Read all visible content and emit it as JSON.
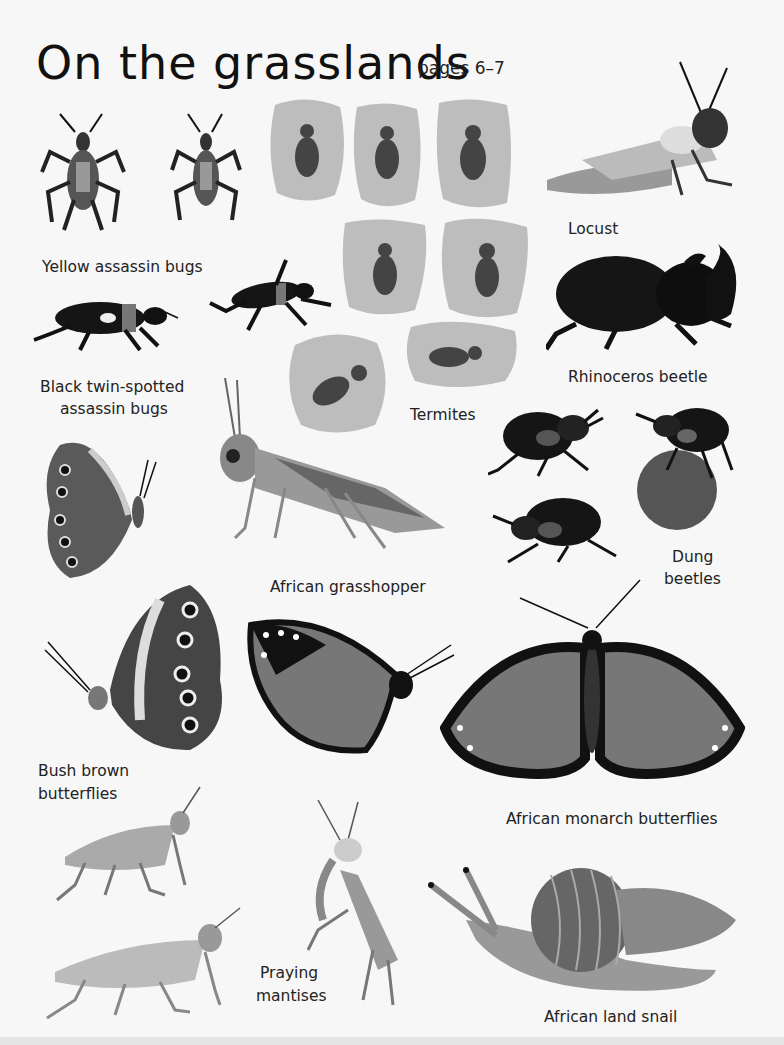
{
  "page": {
    "title": "On the grasslands",
    "subtitle": "pages 6–7"
  },
  "labels": {
    "yellow_assassin": "Yellow assassin bugs",
    "black_assassin_1": "Black twin-spotted",
    "black_assassin_2": "assassin bugs",
    "locust": "Locust",
    "rhino": "Rhinoceros beetle",
    "termites": "Termites",
    "grasshopper": "African grasshopper",
    "dung_1": "Dung",
    "dung_2": "beetles",
    "bush_1": "Bush brown",
    "bush_2": "butterflies",
    "monarch": "African monarch butterflies",
    "mantis_1": "Praying",
    "mantis_2": "mantises",
    "snail": "African land snail"
  },
  "colors": {
    "ink": "#1a1a1a",
    "termite_bg": "#b9b9b9",
    "mid_gray": "#8a8a8a",
    "light_gray": "#c8c8c8"
  }
}
